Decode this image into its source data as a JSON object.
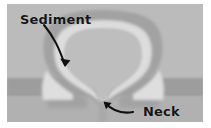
{
  "figure": {
    "name": "sediment-injection-neck-diagram",
    "type": "geological-cross-section",
    "background_color": "#ffffff",
    "frame_border_color": "#ffffff"
  },
  "labels": {
    "sediment": "Sediment",
    "neck": "Neck"
  },
  "annotations": [
    {
      "name": "sediment-arrow",
      "points_from": "Sediment",
      "points_to": "upper-left-sediment-layer-contact",
      "style": "curved-arrow",
      "color": "#111111"
    },
    {
      "name": "neck-arrow",
      "points_from": "Neck",
      "points_to": "narrow-constriction-of-intrusion",
      "style": "curved-arrow",
      "color": "#111111"
    }
  ],
  "colors": {
    "sediment_upper": "#b9b9b9",
    "sediment_dark_band": "#9d9d9d",
    "sediment_lower": "#b0b0b0",
    "intrusion_outer": "#a3a3a3",
    "intrusion_rim": "#d8d8d8",
    "intrusion_core": "#bdbdbd",
    "label_text": "#141414",
    "arrow": "#111111"
  },
  "structure": {
    "layers": [
      {
        "name": "upper-sediment-layer",
        "y_top": 0,
        "y_bottom": 74,
        "color": "#b9b9b9"
      },
      {
        "name": "dark-sediment-band",
        "y_top": 74,
        "y_bottom": 92,
        "color": "#9d9d9d"
      },
      {
        "name": "lower-sediment-layer",
        "y_top": 92,
        "y_bottom": 118,
        "color": "#b0b0b0"
      }
    ],
    "intrusion": {
      "name": "balloon-shaped-sediment-intrusion",
      "head_shape": "rounded-bulb",
      "neck_shape": "narrow-constriction",
      "neck_x": 96,
      "neck_y": 96
    }
  }
}
